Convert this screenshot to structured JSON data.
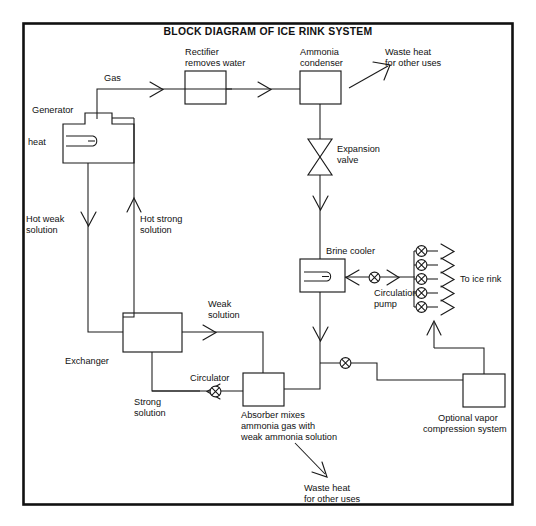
{
  "diagram": {
    "title": "BLOCK DIAGRAM OF ICE RINK SYSTEM",
    "blocks": {
      "generator": "Generator",
      "heat": "heat",
      "rectifier": "Rectifier\nremoves water",
      "rectifier_l1": "Rectifier",
      "rectifier_l2": "removes water",
      "condenser_l1": "Ammonia",
      "condenser_l2": "condenser",
      "expansion_l1": "Expansion",
      "expansion_l2": "valve",
      "brine_cooler": "Brine cooler",
      "circulation_l1": "Circulation",
      "circulation_l2": "pump",
      "to_ice_rink": "To ice rink",
      "exchanger": "Exchanger",
      "circulator": "Circulator",
      "absorber_l1": "Absorber mixes",
      "absorber_l2": "ammonia gas with",
      "absorber_l3": "weak ammonia solution",
      "vapor_l1": "Optional vapor",
      "vapor_l2": "compression system"
    },
    "flow_labels": {
      "gas": "Gas",
      "waste_heat_top_l1": "Waste heat",
      "waste_heat_top_l2": "for other uses",
      "waste_heat_bottom_l1": "Waste heat",
      "waste_heat_bottom_l2": "for other uses",
      "hot_weak_l1": "Hot weak",
      "hot_weak_l2": "solution",
      "hot_strong_l1": "Hot strong",
      "hot_strong_l2": "solution",
      "weak_l1": "Weak",
      "weak_l2": "solution",
      "strong_l1": "Strong",
      "strong_l2": "solution"
    },
    "icons": {
      "valve_count_manifold": 5,
      "pump_symbol": "circle-x-pump-icon",
      "expansion_valve_symbol": "bowtie-valve-icon",
      "coil_symbol": "hairpin-coil-icon"
    },
    "colors": {
      "line": "#1a1a1a",
      "frame": "#111111",
      "background": "#ffffff",
      "text": "#111111"
    }
  }
}
